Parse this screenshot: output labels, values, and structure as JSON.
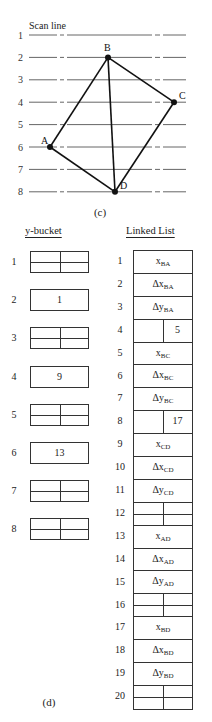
{
  "figure_c": {
    "caption": "(c)",
    "scan_line_label": "Scan line",
    "scan_lines": [
      "1",
      "2",
      "3",
      "4",
      "5",
      "6",
      "7",
      "8"
    ],
    "vertices": [
      {
        "label": "A",
        "scan_line": 6
      },
      {
        "label": "B",
        "scan_line": 2
      },
      {
        "label": "C",
        "scan_line": 4
      },
      {
        "label": "D",
        "scan_line": 8
      }
    ],
    "edges": [
      "BA",
      "BC",
      "CD",
      "AD",
      "BD"
    ]
  },
  "figure_d": {
    "caption": "(d)",
    "y_bucket": {
      "heading": "y-bucket",
      "buckets": [
        {
          "index": "1",
          "value": null
        },
        {
          "index": "2",
          "value": "1"
        },
        {
          "index": "3",
          "value": null
        },
        {
          "index": "4",
          "value": "9"
        },
        {
          "index": "5",
          "value": null
        },
        {
          "index": "6",
          "value": "13"
        },
        {
          "index": "7",
          "value": null
        },
        {
          "index": "8",
          "value": null
        }
      ]
    },
    "linked_list": {
      "heading": "Linked List",
      "rows": [
        {
          "index": "1",
          "main": "x",
          "sub": "BA"
        },
        {
          "index": "2",
          "main": "Δx",
          "sub": "BA"
        },
        {
          "index": "3",
          "main": "Δy",
          "sub": "BA"
        },
        {
          "index": "4",
          "pointer": "5"
        },
        {
          "index": "5",
          "main": "x",
          "sub": "BC"
        },
        {
          "index": "6",
          "main": "Δx",
          "sub": "BC"
        },
        {
          "index": "7",
          "main": "Δy",
          "sub": "BC"
        },
        {
          "index": "8",
          "pointer": "17"
        },
        {
          "index": "9",
          "main": "x",
          "sub": "CD"
        },
        {
          "index": "10",
          "main": "Δx",
          "sub": "CD"
        },
        {
          "index": "11",
          "main": "Δy",
          "sub": "CD"
        },
        {
          "index": "12",
          "empty": true
        },
        {
          "index": "13",
          "main": "x",
          "sub": "AD"
        },
        {
          "index": "14",
          "main": "Δx",
          "sub": "AD"
        },
        {
          "index": "15",
          "main": "Δy",
          "sub": "AD"
        },
        {
          "index": "16",
          "empty": true
        },
        {
          "index": "17",
          "main": "x",
          "sub": "BD"
        },
        {
          "index": "18",
          "main": "Δx",
          "sub": "BD"
        },
        {
          "index": "19",
          "main": "Δy",
          "sub": "BD"
        },
        {
          "index": "20",
          "empty": true
        }
      ]
    }
  }
}
